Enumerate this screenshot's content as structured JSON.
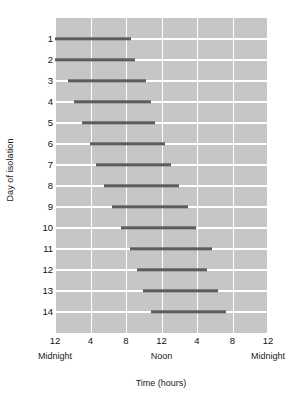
{
  "chart_data": {
    "type": "bar",
    "orientation": "horizontal",
    "title": "",
    "xlabel": "Time (hours)",
    "ylabel": "Day of isolation",
    "xlim": [
      0,
      24
    ],
    "ylim": [
      0.5,
      14.5
    ],
    "grid": true,
    "legend": null,
    "x_tick_values": [
      0,
      4,
      8,
      12,
      16,
      20,
      24
    ],
    "x_tick_labels": [
      "12",
      "4",
      "8",
      "12",
      "4",
      "8",
      "12"
    ],
    "x_period_labels": [
      {
        "label": "Midnight",
        "value": 0
      },
      {
        "label": "Noon",
        "value": 12
      },
      {
        "label": "Midnight",
        "value": 24
      }
    ],
    "categories": [
      "1",
      "2",
      "3",
      "4",
      "5",
      "6",
      "7",
      "8",
      "9",
      "10",
      "11",
      "12",
      "13",
      "14"
    ],
    "bars": [
      {
        "day": "1",
        "start": 0.0,
        "end": 8.6
      },
      {
        "day": "2",
        "start": 0.0,
        "end": 9.0
      },
      {
        "day": "3",
        "start": 1.5,
        "end": 10.3
      },
      {
        "day": "4",
        "start": 2.1,
        "end": 10.8
      },
      {
        "day": "5",
        "start": 3.0,
        "end": 11.3
      },
      {
        "day": "6",
        "start": 3.9,
        "end": 12.4
      },
      {
        "day": "7",
        "start": 4.6,
        "end": 13.1
      },
      {
        "day": "8",
        "start": 5.5,
        "end": 14.0
      },
      {
        "day": "9",
        "start": 6.4,
        "end": 15.0
      },
      {
        "day": "10",
        "start": 7.4,
        "end": 15.9
      },
      {
        "day": "11",
        "start": 8.5,
        "end": 17.7
      },
      {
        "day": "12",
        "start": 9.2,
        "end": 17.1
      },
      {
        "day": "13",
        "start": 9.9,
        "end": 18.4
      },
      {
        "day": "14",
        "start": 10.8,
        "end": 19.3
      }
    ],
    "colors": {
      "plot_background": "#c6c6c6",
      "gridline": "#ffffff",
      "bar": "#5d5d5d",
      "text": "#111111",
      "page_background": "#ffffff"
    }
  }
}
